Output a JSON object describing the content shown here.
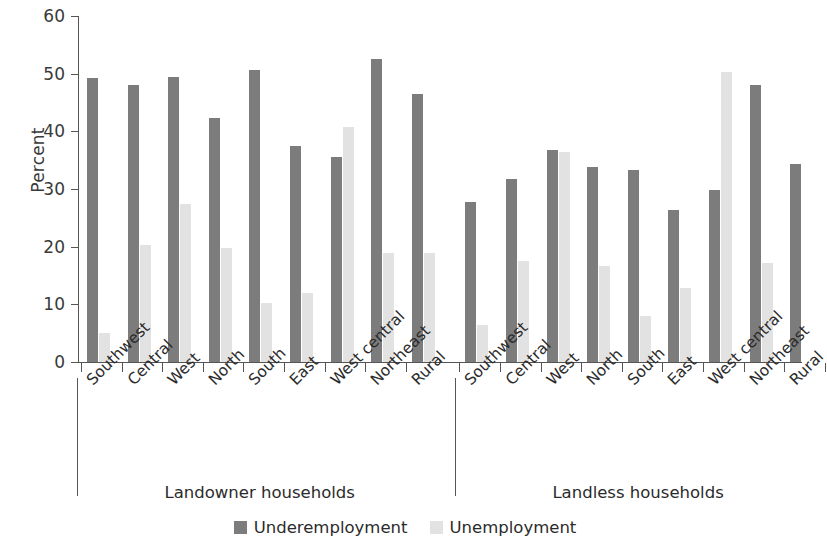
{
  "chart_data": {
    "type": "bar",
    "title": "",
    "xlabel": "",
    "ylabel": "Percent",
    "ylim": [
      0,
      60
    ],
    "ytick_values": [
      0,
      10,
      20,
      30,
      40,
      50,
      60
    ],
    "ytick_labels": [
      "0",
      "10",
      "20",
      "30",
      "40",
      "50",
      "60"
    ],
    "grid": false,
    "legend_position": "bottom-center",
    "colors": {
      "underemployment": "#7c7c7c",
      "unemployment": "#e2e2e2",
      "axis": "#555555",
      "text": "#2b2b2b",
      "background": "#ffffff"
    },
    "legend": [
      {
        "name": "Underemployment",
        "color": "#7c7c7c"
      },
      {
        "name": "Unemployment",
        "color": "#e2e2e2"
      }
    ],
    "groups": [
      {
        "label": "Landowner households",
        "categories": [
          "Southwest",
          "Central",
          "West",
          "North",
          "South",
          "East",
          "West central",
          "Northeast",
          "Rural"
        ],
        "series": [
          {
            "name": "Underemployment",
            "values": [
              49.2,
              48.0,
              49.4,
              42.4,
              50.7,
              37.4,
              35.6,
              52.5,
              46.4
            ]
          },
          {
            "name": "Unemployment",
            "values": [
              5.0,
              20.3,
              27.4,
              19.8,
              10.2,
              11.9,
              40.8,
              18.9,
              18.9
            ]
          }
        ]
      },
      {
        "label": "Landless households",
        "categories": [
          "Southwest",
          "Central",
          "West",
          "North",
          "South",
          "East",
          "West central",
          "Northeast",
          "Rural"
        ],
        "series": [
          {
            "name": "Underemployment",
            "values": [
              27.8,
              31.7,
              36.7,
              33.9,
              33.3,
              26.3,
              29.8,
              48.0,
              34.3
            ]
          },
          {
            "name": "Unemployment",
            "values": [
              6.5,
              17.6,
              36.5,
              16.6,
              8.0,
              12.8,
              50.3,
              17.2,
              0.0
            ]
          }
        ]
      }
    ]
  }
}
